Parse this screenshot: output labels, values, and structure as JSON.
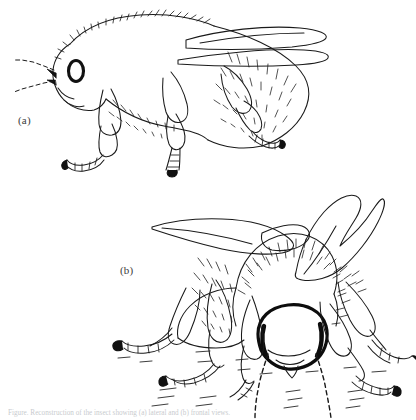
{
  "figure": {
    "background_color": "#ffffff",
    "ink_color": "#1a1a1a",
    "label_color": "#3b3b3b",
    "medium": "pen-and-ink line drawing",
    "panels": [
      {
        "id": "a",
        "label": "(a)",
        "view": "lateral side view of a hairy bee with folded wings, dashed antennae, three legs and dark compound eye"
      },
      {
        "id": "b",
        "label": "(b)",
        "view": "frontal three-quarter view of the same bee with raised wings, bold head outline, dark eyes and dashed antennae standing on a dashed ground line"
      }
    ],
    "caption": "Figure. Reconstruction of the insect showing (a) lateral and (b) frontal views."
  }
}
